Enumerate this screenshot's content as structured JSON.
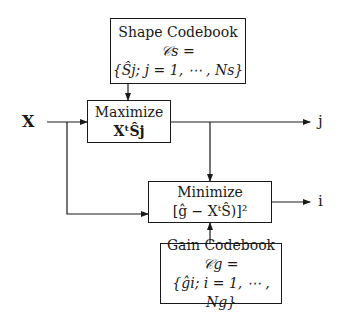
{
  "diagram": {
    "input_label": "X",
    "output_j_label": "j",
    "output_i_label": "i",
    "shape_codebook": {
      "title": "Shape Codebook",
      "line2": "𝒞s =",
      "line3": "{Ŝj; j = 1, ⋯ , Ns}"
    },
    "maximize": {
      "title": "Maximize",
      "expr": "XᵗŜj"
    },
    "minimize": {
      "title": "Minimize",
      "expr": "[ĝ − XᵗŜ)]²"
    },
    "gain_codebook": {
      "title": "Gain Codebook",
      "line2": "𝒞g =",
      "line3": "{ĝi; i = 1, ⋯ , Ng}"
    }
  }
}
